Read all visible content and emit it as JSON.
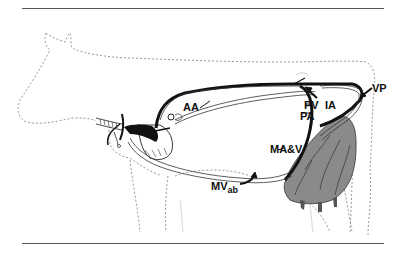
{
  "figure": {
    "labels": {
      "aa": "AA",
      "pv": "PV",
      "ia": "IA",
      "pa": "PA",
      "vp": "VP",
      "mav": "MA&V",
      "mv_main": "MV",
      "mv_sub": "ab"
    },
    "colors": {
      "vessel": "#111111",
      "outline": "#9a9a9a",
      "rule": "#555555",
      "udder": "#8a8a8a"
    }
  }
}
